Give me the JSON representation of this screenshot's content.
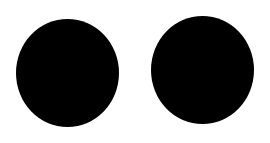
{
  "canvas": {
    "background": "#ffffff",
    "width": 270,
    "height": 143
  },
  "shapes": [
    {
      "type": "ellipse",
      "name": "left-dot",
      "color": "#000000",
      "x": 16,
      "y": 19,
      "width": 103,
      "height": 108
    },
    {
      "type": "ellipse",
      "name": "right-dot",
      "color": "#000000",
      "x": 151,
      "y": 16,
      "width": 103,
      "height": 108
    }
  ]
}
